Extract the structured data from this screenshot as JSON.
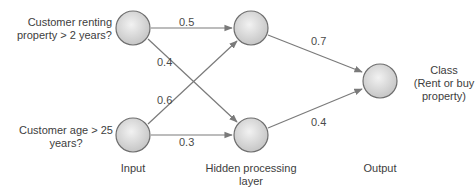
{
  "diagram": {
    "type": "neural-network",
    "inputs": [
      {
        "id": "in1",
        "label_line1": "Customer renting",
        "label_line2": "property > 2 years?"
      },
      {
        "id": "in2",
        "label_line1": "Customer age > 25",
        "label_line2": "years?"
      }
    ],
    "hidden": [
      {
        "id": "h1"
      },
      {
        "id": "h2"
      }
    ],
    "output": {
      "id": "out",
      "label_line1": "Class",
      "label_line2": "(Rent or buy",
      "label_line3": "property)"
    },
    "weights": {
      "in1_h1": "0.5",
      "in1_h2": "0.4",
      "in2_h1": "0.6",
      "in2_h2": "0.3",
      "h1_out": "0.7",
      "h2_out": "0.4"
    },
    "layer_labels": {
      "input": "Input",
      "hidden_line1": "Hidden processing",
      "hidden_line2": "layer",
      "output": "Output"
    },
    "colors": {
      "edge": "#7a7a7a",
      "node_stroke": "#6e6e6e",
      "node_fill_light": "#eeeeee",
      "node_fill_dark": "#c4c4c4"
    }
  }
}
